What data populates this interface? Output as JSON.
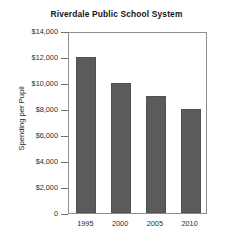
{
  "chart_data": {
    "type": "bar",
    "title": "Riverdale Public School System",
    "xlabel": "",
    "ylabel": "Spending per Pupil",
    "categories": [
      "1995",
      "2000",
      "2005",
      "2010"
    ],
    "values": [
      12000,
      10000,
      9000,
      8000
    ],
    "ylim": [
      0,
      14000
    ],
    "ytick_values": [
      14000,
      12000,
      10000,
      8000,
      6000,
      4000,
      2000,
      0
    ],
    "ytick_labels": [
      "$14,000",
      "$12,000",
      "$10,000",
      "$8,000",
      "$6,000",
      "$4,000",
      "$2,000",
      "0"
    ],
    "grid": false,
    "legend": null,
    "bar_color": "#5b5b5b",
    "axis_color": "#8e8e8e",
    "background": "#ffffff"
  }
}
